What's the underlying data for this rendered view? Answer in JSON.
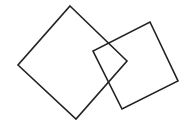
{
  "diagram": {
    "background": "#ffffff",
    "stroke_color": "#222222",
    "stroke_width": 1.6,
    "shapes": [
      {
        "name": "square-left",
        "points": "70,6 127,61 76,119 18,65"
      },
      {
        "name": "square-right",
        "points": "150,22 178,81 122,109 93,51"
      }
    ]
  }
}
